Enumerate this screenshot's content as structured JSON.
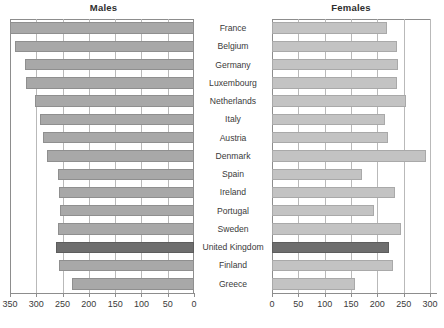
{
  "chart_data": {
    "type": "bar",
    "title": "",
    "orientation": "horizontal",
    "layout": "population-pyramid",
    "panels": [
      {
        "name": "males",
        "title": "Males",
        "xlabel": "",
        "ylabel": "",
        "axis_reversed": true,
        "xlim": [
          350,
          0
        ],
        "ticks": [
          350,
          300,
          250,
          200,
          150,
          100,
          50,
          0
        ],
        "grid": true,
        "bar_color": "#a8a8a8",
        "highlight_color": "#6e6e6e",
        "values": [
          350,
          340,
          322,
          320,
          303,
          293,
          287,
          280,
          258,
          257,
          255,
          258,
          262,
          256,
          232
        ]
      },
      {
        "name": "females",
        "title": "Females",
        "xlabel": "",
        "ylabel": "",
        "axis_reversed": false,
        "xlim": [
          0,
          300
        ],
        "ticks": [
          0,
          50,
          100,
          150,
          200,
          250,
          300
        ],
        "grid": true,
        "bar_color": "#c3c3c3",
        "highlight_color": "#6e6e6e",
        "values": [
          218,
          238,
          240,
          238,
          255,
          214,
          220,
          293,
          170,
          233,
          193,
          245,
          222,
          230,
          157
        ]
      }
    ],
    "categories": [
      "France",
      "Belgium",
      "Germany",
      "Luxembourg",
      "Netherlands",
      "Italy",
      "Austria",
      "Denmark",
      "Spain",
      "Ireland",
      "Portugal",
      "Sweden",
      "United Kingdom",
      "Finland",
      "Greece"
    ],
    "highlight_category": "United Kingdom",
    "legend": []
  }
}
